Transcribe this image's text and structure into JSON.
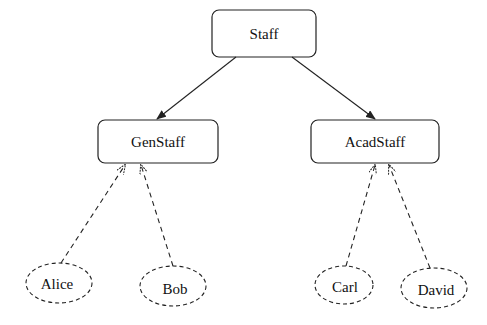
{
  "diagram": {
    "type": "class-hierarchy",
    "root": {
      "label": "Staff",
      "shape": "rounded-rectangle"
    },
    "classes": [
      {
        "label": "GenStaff",
        "shape": "rounded-rectangle",
        "parent": "Staff"
      },
      {
        "label": "AcadStaff",
        "shape": "rounded-rectangle",
        "parent": "Staff"
      }
    ],
    "instances": [
      {
        "label": "Alice",
        "shape": "dashed-ellipse",
        "instance_of": "GenStaff"
      },
      {
        "label": "Bob",
        "shape": "dashed-ellipse",
        "instance_of": "GenStaff"
      },
      {
        "label": "Carl",
        "shape": "dashed-ellipse",
        "instance_of": "AcadStaff"
      },
      {
        "label": "David",
        "shape": "dashed-ellipse",
        "instance_of": "AcadStaff"
      }
    ],
    "edges": [
      {
        "from": "Staff",
        "to": "GenStaff",
        "style": "solid-arrow"
      },
      {
        "from": "Staff",
        "to": "AcadStaff",
        "style": "solid-arrow"
      },
      {
        "from": "Alice",
        "to": "GenStaff",
        "style": "dashed-arrow"
      },
      {
        "from": "Bob",
        "to": "GenStaff",
        "style": "dashed-arrow"
      },
      {
        "from": "Carl",
        "to": "AcadStaff",
        "style": "dashed-arrow"
      },
      {
        "from": "David",
        "to": "AcadStaff",
        "style": "dashed-arrow"
      }
    ]
  }
}
